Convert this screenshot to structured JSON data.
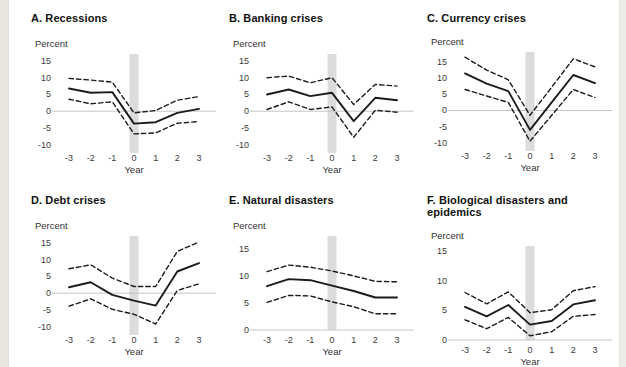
{
  "page": {
    "background": "#ffffff",
    "left_strip_color": "#e9e6e0",
    "right_strip_color": "#edece8"
  },
  "colors": {
    "solid_line": "#1b1b1b",
    "dashed_line": "#1b1b1b",
    "zero_line": "#c6c6c6",
    "event_band": "#dcdcdc",
    "tick_text": "#3a3a3a"
  },
  "chart_data": [
    {
      "type": "line",
      "title": "A. Recessions",
      "ylabel": "Percent",
      "xlabel": "Year",
      "x": [
        -3,
        -2,
        -1,
        0,
        1,
        2,
        3
      ],
      "xticks": [
        -3,
        -2,
        -1,
        0,
        1,
        2,
        3
      ],
      "yticks": [
        15,
        10,
        5,
        0,
        -5,
        -10
      ],
      "ylim": [
        -11,
        16.5
      ],
      "event_band_x": 0,
      "series": [
        {
          "name": "mean",
          "style": "solid",
          "values": [
            6.8,
            5.5,
            5.7,
            -3.7,
            -3.3,
            -0.5,
            0.7
          ]
        },
        {
          "name": "upper-band",
          "style": "dashed",
          "values": [
            9.8,
            9.3,
            8.7,
            -0.5,
            0.2,
            3.3,
            4.4
          ]
        },
        {
          "name": "lower-band",
          "style": "dashed",
          "values": [
            3.6,
            2.2,
            2.8,
            -6.8,
            -6.5,
            -3.6,
            -3.1
          ]
        }
      ]
    },
    {
      "type": "line",
      "title": "B. Banking crises",
      "ylabel": "Percent",
      "xlabel": "Year",
      "x": [
        -3,
        -2,
        -1,
        0,
        1,
        2,
        3
      ],
      "xticks": [
        -3,
        -2,
        -1,
        0,
        1,
        2,
        3
      ],
      "yticks": [
        15,
        10,
        5,
        0,
        -5,
        -10
      ],
      "ylim": [
        -11,
        16.5
      ],
      "event_band_x": 0,
      "series": [
        {
          "name": "mean",
          "style": "solid",
          "values": [
            5.0,
            6.5,
            4.5,
            5.5,
            -3.0,
            4.0,
            3.3
          ]
        },
        {
          "name": "upper-band",
          "style": "dashed",
          "values": [
            10.0,
            10.5,
            8.5,
            10.0,
            2.0,
            8.0,
            7.5
          ]
        },
        {
          "name": "lower-band",
          "style": "dashed",
          "values": [
            0.5,
            2.8,
            0.5,
            1.3,
            -7.8,
            0.3,
            -0.3
          ]
        }
      ]
    },
    {
      "type": "line",
      "title": "C. Currency crises",
      "ylabel": "Percent",
      "xlabel": "Year",
      "x": [
        -3,
        -2,
        -1,
        0,
        1,
        2,
        3
      ],
      "xticks": [
        -3,
        -2,
        -1,
        0,
        1,
        2,
        3
      ],
      "yticks": [
        15,
        10,
        5,
        0,
        -5,
        -10
      ],
      "ylim": [
        -11,
        17.5
      ],
      "event_band_x": 0,
      "series": [
        {
          "name": "mean",
          "style": "solid",
          "values": [
            11.5,
            8.3,
            6.0,
            -6.0,
            2.5,
            11.0,
            8.5
          ]
        },
        {
          "name": "upper-band",
          "style": "dashed",
          "values": [
            16.5,
            12.5,
            9.5,
            -1.5,
            7.2,
            16.0,
            13.5
          ]
        },
        {
          "name": "lower-band",
          "style": "dashed",
          "values": [
            6.5,
            4.5,
            2.5,
            -9.5,
            -1.5,
            6.5,
            4.0
          ]
        }
      ]
    },
    {
      "type": "line",
      "title": "D. Debt crises",
      "ylabel": "Percent",
      "xlabel": "Year",
      "x": [
        -3,
        -2,
        -1,
        0,
        1,
        2,
        3
      ],
      "xticks": [
        -3,
        -2,
        -1,
        0,
        1,
        2,
        3
      ],
      "yticks": [
        15,
        10,
        5,
        0,
        -5,
        -10
      ],
      "ylim": [
        -11,
        16.5
      ],
      "event_band_x": 0,
      "series": [
        {
          "name": "mean",
          "style": "solid",
          "values": [
            1.8,
            3.3,
            -0.5,
            -2.2,
            -3.7,
            6.5,
            9.0
          ]
        },
        {
          "name": "upper-band",
          "style": "dashed",
          "values": [
            7.3,
            8.5,
            4.5,
            2.0,
            2.0,
            12.5,
            15.3
          ]
        },
        {
          "name": "lower-band",
          "style": "dashed",
          "values": [
            -3.9,
            -1.7,
            -4.8,
            -6.3,
            -9.2,
            0.8,
            2.8
          ]
        }
      ]
    },
    {
      "type": "line",
      "title": "E. Natural disasters",
      "ylabel": "Percent",
      "xlabel": "Year",
      "x": [
        -3,
        -2,
        -1,
        0,
        1,
        2,
        3
      ],
      "xticks": [
        -3,
        -2,
        -1,
        0,
        1,
        2,
        3
      ],
      "yticks": [
        15,
        10,
        5,
        0
      ],
      "ylim": [
        0,
        17
      ],
      "event_band_x": 0,
      "series": [
        {
          "name": "mean",
          "style": "solid",
          "values": [
            8.1,
            9.4,
            9.2,
            8.2,
            7.2,
            6.0,
            6.0
          ]
        },
        {
          "name": "upper-band",
          "style": "dashed",
          "values": [
            10.8,
            12.0,
            11.6,
            10.9,
            10.0,
            9.0,
            8.9
          ]
        },
        {
          "name": "lower-band",
          "style": "dashed",
          "values": [
            5.1,
            6.4,
            6.3,
            5.2,
            4.3,
            3.0,
            3.0
          ]
        }
      ]
    },
    {
      "type": "line",
      "title": "F. Biological disasters and epidemics",
      "ylabel": "Percent",
      "xlabel": "Year",
      "x": [
        -3,
        -2,
        -1,
        0,
        1,
        2,
        3
      ],
      "xticks": [
        -3,
        -2,
        -1,
        0,
        1,
        2,
        3
      ],
      "yticks": [
        15,
        10,
        5,
        0
      ],
      "ylim": [
        0,
        15.5
      ],
      "event_band_x": 0,
      "series": [
        {
          "name": "mean",
          "style": "solid",
          "values": [
            5.6,
            4.0,
            5.9,
            2.6,
            3.2,
            6.0,
            6.7
          ]
        },
        {
          "name": "upper-band",
          "style": "dashed",
          "values": [
            8.0,
            6.1,
            8.1,
            4.6,
            5.1,
            8.3,
            9.0
          ]
        },
        {
          "name": "lower-band",
          "style": "dashed",
          "values": [
            3.4,
            1.9,
            3.8,
            0.7,
            1.4,
            4.0,
            4.3
          ]
        }
      ]
    }
  ]
}
